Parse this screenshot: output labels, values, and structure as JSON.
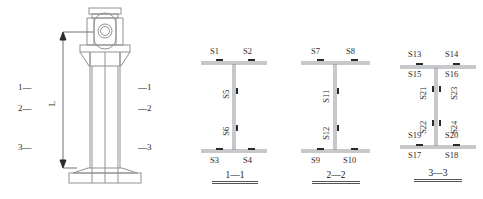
{
  "figure": {
    "type": "engineering-diagram",
    "line_color": "#8e9196",
    "gauge_color": "#2a2a2a",
    "text_color": "#2b2b2b"
  },
  "elevation": {
    "dimension_label": "L",
    "left_ticks": [
      {
        "label": "1",
        "dash": "—"
      },
      {
        "label": "2",
        "dash": "—"
      },
      {
        "label": "3",
        "dash": "—"
      }
    ],
    "right_ticks": [
      {
        "dash": "—",
        "label": "1"
      },
      {
        "dash": "—",
        "label": "2"
      },
      {
        "dash": "—",
        "label": "3"
      }
    ]
  },
  "sections": [
    {
      "id": "section-1-1",
      "caption": "1—1",
      "top_above": [],
      "top_below": [
        "S1",
        "S2"
      ],
      "web_left": [
        "S5",
        "S6"
      ],
      "web_right": [],
      "bottom_above": [],
      "bottom_below": [
        "S3",
        "S4"
      ],
      "top_labels_position": "above-flange",
      "bottom_labels_position": "below-flange",
      "top": [
        "S1",
        "S2"
      ],
      "bottom": [
        "S3",
        "S4"
      ],
      "web": [
        "S5",
        "S6"
      ]
    },
    {
      "id": "section-2-2",
      "caption": "2—2",
      "top": [
        "S7",
        "S8"
      ],
      "bottom": [
        "S9",
        "S10"
      ],
      "web": [
        "S11",
        "S12"
      ]
    },
    {
      "id": "section-3-3",
      "caption": "3—3",
      "top_above": [
        "S13",
        "S14"
      ],
      "top_below": [
        "S15",
        "S16"
      ],
      "web_left": [
        "S21",
        "S22"
      ],
      "web_right": [
        "S23",
        "S24"
      ],
      "bottom_above": [
        "S19",
        "S20"
      ],
      "bottom_below": [
        "S17",
        "S18"
      ]
    }
  ]
}
